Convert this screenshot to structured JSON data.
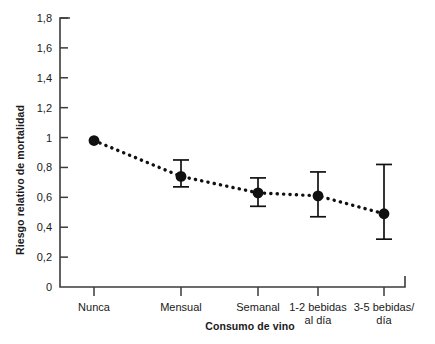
{
  "chart_data": {
    "type": "line",
    "title": "",
    "subtitle": "",
    "xlabel": "Consumo de vino",
    "ylabel": "Riesgo relativo de mortalidad",
    "categories": [
      "Nunca",
      "Mensual",
      "Semanal",
      "1-2 bebidas al día",
      "3-5 bebidas/ día"
    ],
    "category_lines": [
      [
        "Nunca"
      ],
      [
        "Mensual"
      ],
      [
        "Semanal"
      ],
      [
        "1-2 bebidas",
        "al día"
      ],
      [
        "3-5 bebidas/",
        "día"
      ]
    ],
    "values": [
      0.98,
      0.74,
      0.63,
      0.61,
      0.49
    ],
    "error_low": [
      0.98,
      0.67,
      0.54,
      0.47,
      0.32
    ],
    "error_high": [
      0.98,
      0.85,
      0.73,
      0.77,
      0.82
    ],
    "has_error_bars": [
      false,
      true,
      true,
      true,
      true
    ],
    "ylim": [
      0,
      1.8
    ],
    "yticks": [
      0,
      0.2,
      0.4,
      0.6,
      0.8,
      1.0,
      1.2,
      1.4,
      1.6,
      1.8
    ],
    "ytick_labels": [
      "0",
      "0,2",
      "0,4",
      "0,6",
      "0,8",
      "1",
      "1,2",
      "1,4",
      "1,6",
      "1,8"
    ],
    "grid": false,
    "legend": false,
    "legend_position": "none",
    "line_style": "dotted",
    "marker": "filled-circle",
    "colors": {
      "series": "#111111",
      "axis": "#3b3b3b",
      "text": "#1a1a1a",
      "background": "#ffffff"
    }
  }
}
